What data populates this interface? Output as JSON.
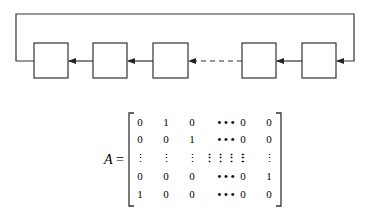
{
  "diagram": {
    "stages": 5,
    "gap_between": [
      3,
      4
    ]
  },
  "matrix": {
    "label": "A",
    "equals": "=",
    "rows": [
      [
        "0",
        "1",
        "0",
        "• • •",
        "0",
        "0"
      ],
      [
        "0",
        "0",
        "1",
        "• • •",
        "0",
        "0"
      ],
      [
        "⋮",
        "⋮",
        "⋮",
        "⋮⋮⋮⋮",
        "⋮",
        "⋮"
      ],
      [
        "0",
        "0",
        "0",
        "• • •",
        "0",
        "1"
      ],
      [
        "1",
        "0",
        "0",
        "• • •",
        "0",
        "0"
      ]
    ]
  }
}
